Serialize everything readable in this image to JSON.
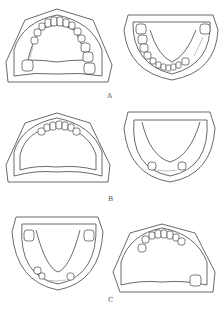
{
  "figure": {
    "panels": [
      {
        "id": "A",
        "label": "A",
        "left": "maxilla-with-teeth",
        "right": "mandible-with-teeth"
      },
      {
        "id": "B",
        "label": "B",
        "left": "maxilla-anterior-teeth",
        "right": "mandible-two-premolars"
      },
      {
        "id": "C",
        "label": "C",
        "left": "mandible-molars-premolars",
        "right": "maxilla-anterior-and-molar"
      }
    ]
  }
}
